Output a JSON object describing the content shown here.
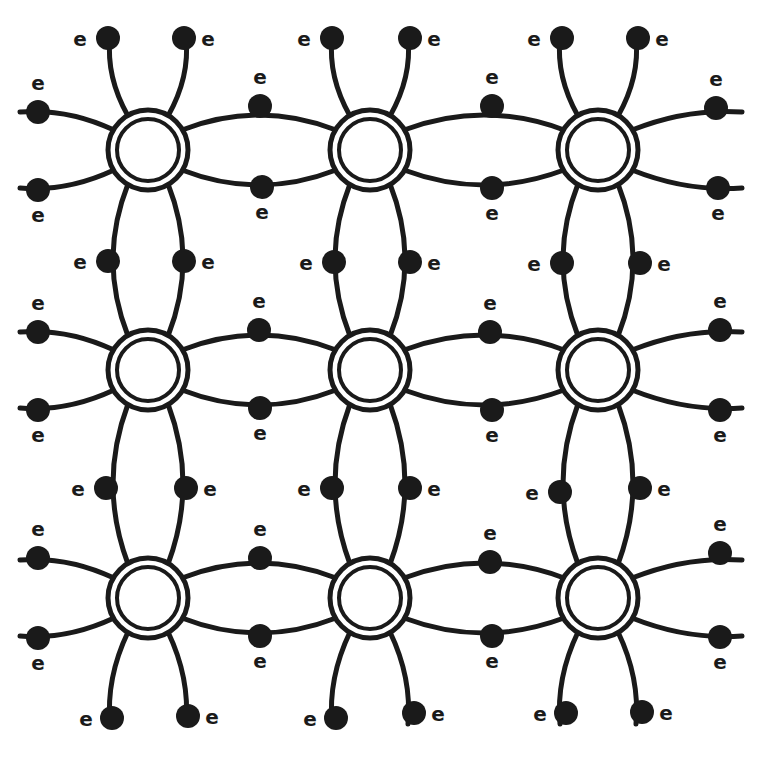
{
  "colors": {
    "ink": "#1a1a1a",
    "background": "#ffffff"
  },
  "electron_label": "e",
  "lattice": {
    "columns_x": [
      148,
      370,
      598
    ],
    "rows_y": [
      150,
      370,
      598
    ],
    "atom_outer_radius": 40,
    "atom_inner_radius": 31,
    "electron_radius": 12,
    "bond_offset": 42
  },
  "atoms": [
    {
      "row": 0,
      "col": 0
    },
    {
      "row": 0,
      "col": 1
    },
    {
      "row": 0,
      "col": 2
    },
    {
      "row": 1,
      "col": 0
    },
    {
      "row": 1,
      "col": 1
    },
    {
      "row": 1,
      "col": 2
    },
    {
      "row": 2,
      "col": 0
    },
    {
      "row": 2,
      "col": 1
    },
    {
      "row": 2,
      "col": 2
    }
  ],
  "electrons": [
    {
      "x": 108,
      "y": 38,
      "label_dx": -28,
      "label_dy": 8
    },
    {
      "x": 184,
      "y": 38,
      "label_dx": 24,
      "label_dy": 8
    },
    {
      "x": 332,
      "y": 38,
      "label_dx": -28,
      "label_dy": 8
    },
    {
      "x": 410,
      "y": 38,
      "label_dx": 24,
      "label_dy": 8
    },
    {
      "x": 562,
      "y": 38,
      "label_dx": -28,
      "label_dy": 8
    },
    {
      "x": 638,
      "y": 38,
      "label_dx": 24,
      "label_dy": 8
    },
    {
      "x": 38,
      "y": 112,
      "label_dx": 0,
      "label_dy": -22
    },
    {
      "x": 38,
      "y": 190,
      "label_dx": 0,
      "label_dy": 32
    },
    {
      "x": 260,
      "y": 106,
      "label_dx": 0,
      "label_dy": -22
    },
    {
      "x": 262,
      "y": 187,
      "label_dx": 0,
      "label_dy": 32
    },
    {
      "x": 492,
      "y": 106,
      "label_dx": 0,
      "label_dy": -22
    },
    {
      "x": 492,
      "y": 188,
      "label_dx": 0,
      "label_dy": 32
    },
    {
      "x": 716,
      "y": 108,
      "label_dx": 0,
      "label_dy": -22
    },
    {
      "x": 718,
      "y": 188,
      "label_dx": 0,
      "label_dy": 32
    },
    {
      "x": 108,
      "y": 261,
      "label_dx": -28,
      "label_dy": 8
    },
    {
      "x": 184,
      "y": 261,
      "label_dx": 24,
      "label_dy": 8
    },
    {
      "x": 334,
      "y": 262,
      "label_dx": -28,
      "label_dy": 8
    },
    {
      "x": 410,
      "y": 262,
      "label_dx": 24,
      "label_dy": 8
    },
    {
      "x": 562,
      "y": 263,
      "label_dx": -28,
      "label_dy": 8
    },
    {
      "x": 640,
      "y": 263,
      "label_dx": 24,
      "label_dy": 8
    },
    {
      "x": 38,
      "y": 332,
      "label_dx": 0,
      "label_dy": -22
    },
    {
      "x": 38,
      "y": 410,
      "label_dx": 0,
      "label_dy": 32
    },
    {
      "x": 259,
      "y": 330,
      "label_dx": 0,
      "label_dy": -22
    },
    {
      "x": 260,
      "y": 408,
      "label_dx": 0,
      "label_dy": 32
    },
    {
      "x": 490,
      "y": 332,
      "label_dx": 0,
      "label_dy": -22
    },
    {
      "x": 492,
      "y": 410,
      "label_dx": 0,
      "label_dy": 32
    },
    {
      "x": 720,
      "y": 330,
      "label_dx": 0,
      "label_dy": -22
    },
    {
      "x": 720,
      "y": 410,
      "label_dx": 0,
      "label_dy": 32
    },
    {
      "x": 106,
      "y": 488,
      "label_dx": -28,
      "label_dy": 8
    },
    {
      "x": 186,
      "y": 488,
      "label_dx": 24,
      "label_dy": 8
    },
    {
      "x": 332,
      "y": 488,
      "label_dx": -28,
      "label_dy": 8
    },
    {
      "x": 410,
      "y": 488,
      "label_dx": 24,
      "label_dy": 8
    },
    {
      "x": 560,
      "y": 492,
      "label_dx": -28,
      "label_dy": 8
    },
    {
      "x": 640,
      "y": 488,
      "label_dx": 24,
      "label_dy": 8
    },
    {
      "x": 38,
      "y": 558,
      "label_dx": 0,
      "label_dy": -22
    },
    {
      "x": 38,
      "y": 638,
      "label_dx": 0,
      "label_dy": 32
    },
    {
      "x": 260,
      "y": 558,
      "label_dx": 0,
      "label_dy": -22
    },
    {
      "x": 260,
      "y": 636,
      "label_dx": 0,
      "label_dy": 32
    },
    {
      "x": 490,
      "y": 562,
      "label_dx": 0,
      "label_dy": -22
    },
    {
      "x": 492,
      "y": 636,
      "label_dx": 0,
      "label_dy": 32
    },
    {
      "x": 720,
      "y": 553,
      "label_dx": 0,
      "label_dy": -22
    },
    {
      "x": 720,
      "y": 637,
      "label_dx": 0,
      "label_dy": 32
    },
    {
      "x": 112,
      "y": 718,
      "label_dx": -26,
      "label_dy": 8
    },
    {
      "x": 188,
      "y": 716,
      "label_dx": 24,
      "label_dy": 8
    },
    {
      "x": 336,
      "y": 718,
      "label_dx": -26,
      "label_dy": 8
    },
    {
      "x": 414,
      "y": 713,
      "label_dx": 24,
      "label_dy": 8
    },
    {
      "x": 566,
      "y": 713,
      "label_dx": -26,
      "label_dy": 8
    },
    {
      "x": 642,
      "y": 712,
      "label_dx": 24,
      "label_dy": 8
    }
  ]
}
